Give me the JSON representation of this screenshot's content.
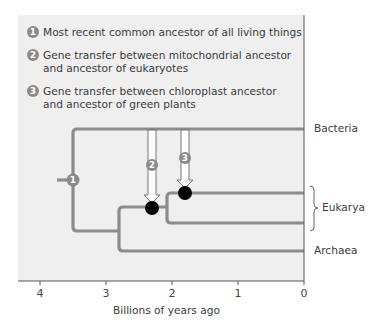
{
  "legend": {
    "items": [
      {
        "number": "1",
        "text": "Most recent common ancestor of all living things"
      },
      {
        "number": "2",
        "text": "Gene transfer between mitochondrial ancestor\nand ancestor of eukaryotes"
      },
      {
        "number": "3",
        "text": "Gene transfer between chloroplast ancestor\nand ancestor of green plants"
      }
    ]
  },
  "tree": {
    "leaves": {
      "bacteria": "Bacteria",
      "eukarya": "Eukarya",
      "archaea": "Archaea"
    },
    "node_labels": {
      "root": "1",
      "mito_transfer": "2",
      "chloro_transfer": "3"
    },
    "colors": {
      "branch": "#8c8c8c",
      "event_dot": "#000000",
      "badge": "#8a8a8a",
      "panel": "#efefef"
    }
  },
  "axis": {
    "title": "Billions of years ago",
    "ticks": [
      "4",
      "3",
      "2",
      "1",
      "0"
    ]
  }
}
